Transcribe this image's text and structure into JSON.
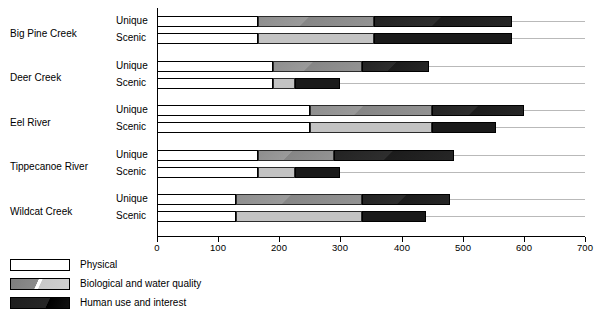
{
  "chart_data": {
    "type": "bar",
    "orientation": "horizontal",
    "stacked": true,
    "title": "",
    "xlabel": "",
    "ylabel": "",
    "xlim": [
      0,
      700
    ],
    "xticks": [
      0,
      100,
      200,
      300,
      400,
      500,
      600,
      700
    ],
    "xticklabels": [
      "0",
      "100",
      "200",
      "300",
      "400",
      "500",
      "600",
      "700"
    ],
    "grid": false,
    "legend_position": "below-left",
    "series": [
      {
        "name": "Physical",
        "color": "#ffffff"
      },
      {
        "name": "Biological and water quality",
        "color": "#9a9a9a"
      },
      {
        "name": "Human use and interest",
        "color": "#1e1e1e"
      }
    ],
    "groups": [
      {
        "label": "Big Pine Creek",
        "rows": [
          {
            "label": "Unique",
            "values": [
              165,
              190,
              225
            ],
            "cumulative": [
              165,
              355,
              580
            ],
            "total": 580
          },
          {
            "label": "Scenic",
            "values": [
              165,
              190,
              225
            ],
            "cumulative": [
              165,
              355,
              580
            ],
            "total": 580
          }
        ]
      },
      {
        "label": "Deer Creek",
        "rows": [
          {
            "label": "Unique",
            "values": [
              190,
              145,
              110
            ],
            "cumulative": [
              190,
              335,
              445
            ],
            "total": 445
          },
          {
            "label": "Scenic",
            "values": [
              190,
              35,
              75
            ],
            "cumulative": [
              190,
              225,
              300
            ],
            "total": 300
          }
        ]
      },
      {
        "label": "Eel River",
        "rows": [
          {
            "label": "Unique",
            "values": [
              250,
              200,
              150
            ],
            "cumulative": [
              250,
              450,
              600
            ],
            "total": 600
          },
          {
            "label": "Scenic",
            "values": [
              250,
              200,
              105
            ],
            "cumulative": [
              250,
              450,
              555
            ],
            "total": 555
          }
        ]
      },
      {
        "label": "Tippecanoe River",
        "rows": [
          {
            "label": "Unique",
            "values": [
              165,
              125,
              195
            ],
            "cumulative": [
              165,
              290,
              485
            ],
            "total": 485
          },
          {
            "label": "Scenic",
            "values": [
              165,
              60,
              75
            ],
            "cumulative": [
              165,
              225,
              300
            ],
            "total": 300
          }
        ]
      },
      {
        "label": "Wildcat Creek",
        "rows": [
          {
            "label": "Unique",
            "values": [
              130,
              205,
              145
            ],
            "cumulative": [
              130,
              335,
              480
            ],
            "total": 480
          },
          {
            "label": "Scenic",
            "values": [
              130,
              205,
              105
            ],
            "cumulative": [
              130,
              335,
              440
            ],
            "total": 440
          }
        ]
      }
    ]
  },
  "legend": {
    "items": [
      {
        "label": "Physical",
        "swatch": "sw-physical"
      },
      {
        "label": "Biological and water quality",
        "swatch": "sw-bio"
      },
      {
        "label": "Human use and interest",
        "swatch": "sw-human"
      }
    ]
  }
}
